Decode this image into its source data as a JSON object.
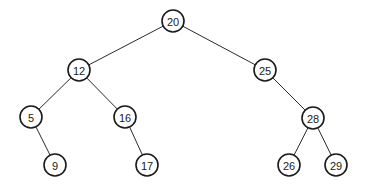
{
  "diagram": {
    "type": "binary-search-tree",
    "node_radius": 11,
    "nodes": [
      {
        "id": "n20",
        "label": "20",
        "x": 173,
        "y": 21
      },
      {
        "id": "n12",
        "label": "12",
        "x": 79,
        "y": 70
      },
      {
        "id": "n25",
        "label": "25",
        "x": 265,
        "y": 70
      },
      {
        "id": "n5",
        "label": "5",
        "x": 31,
        "y": 117
      },
      {
        "id": "n16",
        "label": "16",
        "x": 125,
        "y": 117
      },
      {
        "id": "n28",
        "label": "28",
        "x": 313,
        "y": 118
      },
      {
        "id": "n9",
        "label": "9",
        "x": 55,
        "y": 165
      },
      {
        "id": "n17",
        "label": "17",
        "x": 147,
        "y": 165
      },
      {
        "id": "n26",
        "label": "26",
        "x": 289,
        "y": 165
      },
      {
        "id": "n29",
        "label": "29",
        "x": 336,
        "y": 165
      }
    ],
    "edges": [
      {
        "from": "n20",
        "to": "n12",
        "side": "left"
      },
      {
        "from": "n20",
        "to": "n25",
        "side": "right"
      },
      {
        "from": "n12",
        "to": "n5",
        "side": "left"
      },
      {
        "from": "n12",
        "to": "n16",
        "side": "right"
      },
      {
        "from": "n5",
        "to": "n9",
        "side": "right"
      },
      {
        "from": "n16",
        "to": "n17",
        "side": "right"
      },
      {
        "from": "n25",
        "to": "n28",
        "side": "right"
      },
      {
        "from": "n28",
        "to": "n26",
        "side": "left"
      },
      {
        "from": "n28",
        "to": "n29",
        "side": "right"
      }
    ]
  }
}
